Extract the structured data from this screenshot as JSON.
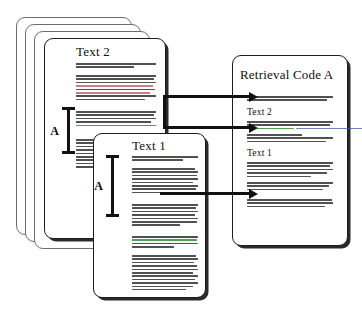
{
  "figure": {
    "name": "retrieval-code-diagram",
    "colors": {
      "ink": "#2b2b2b",
      "border": "#1d1d1d",
      "highlight_green": "#2f8f34",
      "highlight_red": "#b4474a",
      "highlight_blue": "#4455a8",
      "page": "#ffffff"
    }
  },
  "source_stack": {
    "name": "source-document-stack",
    "sheet_count": 4,
    "front_sheet": {
      "heading": "Text 2",
      "measure_label": "A",
      "paragraphs": [
        {
          "lines": 2,
          "accents": []
        },
        {
          "lines": 8,
          "accents": [
            {
              "index": 3,
              "color": "red"
            },
            {
              "index": 5,
              "color": "red"
            }
          ]
        },
        {
          "lines": 5,
          "accents": [
            {
              "index": 4,
              "color": "green"
            }
          ]
        },
        {
          "lines": 9,
          "accents": []
        }
      ]
    }
  },
  "front_doc": {
    "name": "text-1-document",
    "heading": "Text 1",
    "measure_label": "A",
    "paragraphs": [
      {
        "lines": 2,
        "accents": []
      },
      {
        "lines": 8,
        "accents": []
      },
      {
        "lines": 7,
        "accents": []
      },
      {
        "lines": 4,
        "accents": [
          {
            "index": 1,
            "color": "green"
          }
        ]
      },
      {
        "lines": 11,
        "accents": []
      }
    ]
  },
  "retrieval_doc": {
    "name": "retrieval-code-document",
    "title": "Retrieval Code A",
    "sections": [
      {
        "heading": null,
        "paragraphs": [
          {
            "lines": 2,
            "accents": []
          }
        ]
      },
      {
        "heading": "Text 2",
        "paragraphs": [
          {
            "lines": 3,
            "accents": [
              {
                "index": 2,
                "color": "green"
              },
              {
                "index": 2,
                "color": "blue"
              }
            ]
          },
          {
            "lines": 3,
            "accents": []
          }
        ]
      },
      {
        "heading": "Text 1",
        "paragraphs": [
          {
            "lines": 5,
            "accents": []
          },
          {
            "lines": 3,
            "accents": []
          },
          {
            "lines": 3,
            "accents": []
          }
        ]
      }
    ]
  },
  "arrows": [
    {
      "name": "arrow-stack-to-retrieval-top",
      "label": ""
    },
    {
      "name": "arrow-stack-to-retrieval-mid",
      "label": ""
    },
    {
      "name": "arrow-front-to-retrieval-bottom",
      "label": ""
    }
  ]
}
